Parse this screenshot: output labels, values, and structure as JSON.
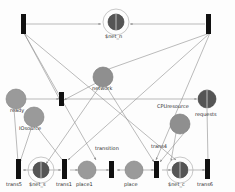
{
  "diagram": {
    "type": "petri-net",
    "colors": {
      "transition_fill": "#111111",
      "place_fill": "#9a9a9a",
      "substitution_fill": "#6e6e6e",
      "arc_stroke": "#8d8d8d",
      "ring_stroke": "#b0b0b0",
      "label_text": "#2a2a2a",
      "background": "#fdfdfd"
    },
    "transitions": [
      {
        "id": "t_top_left",
        "label": "",
        "x": 23,
        "y": 23,
        "w": 5,
        "h": 20
      },
      {
        "id": "t_top_right",
        "label": "",
        "x": 208,
        "y": 23,
        "w": 5,
        "h": 20
      },
      {
        "id": "t_mid",
        "label": "",
        "x": 61,
        "y": 98,
        "w": 5,
        "h": 14
      },
      {
        "id": "t_trans5",
        "label": "trans5",
        "x": 18,
        "y": 166,
        "w": 5,
        "h": 18
      },
      {
        "id": "t_trans1",
        "label": "trans1",
        "x": 64,
        "y": 166,
        "w": 5,
        "h": 18
      },
      {
        "id": "t_transition",
        "label": "transition",
        "x": 111,
        "y": 166,
        "w": 5,
        "h": 16
      },
      {
        "id": "t_trans4",
        "label": "trans4",
        "x": 156,
        "y": 166,
        "w": 5,
        "h": 16
      },
      {
        "id": "t_trans6",
        "label": "trans6",
        "x": 207,
        "y": 166,
        "w": 5,
        "h": 18
      }
    ],
    "places": [
      {
        "id": "p_ready",
        "label": "ready",
        "cx": 16,
        "cy": 99,
        "r": 10
      },
      {
        "id": "p_iosource",
        "label": "IOsource",
        "cx": 34,
        "cy": 117,
        "r": 10
      },
      {
        "id": "p_network",
        "label": "network",
        "cx": 103,
        "cy": 77,
        "r": 10
      },
      {
        "id": "p_cpuresource",
        "label": "CPUresource",
        "cx": 180,
        "cy": 124,
        "r": 10
      },
      {
        "id": "p_place1",
        "label": "place1",
        "cx": 87,
        "cy": 170,
        "r": 9
      },
      {
        "id": "p_place",
        "label": "place",
        "cx": 134,
        "cy": 170,
        "r": 9
      }
    ],
    "substitutions": [
      {
        "id": "s_net_n",
        "label": "$net_n",
        "cx": 116,
        "cy": 22,
        "r": 8,
        "ring": 13
      },
      {
        "id": "s_net_s",
        "label": "$net_s",
        "cx": 41,
        "cy": 170,
        "r": 8,
        "ring": 13
      },
      {
        "id": "s_net_c",
        "label": "$net_c",
        "cx": 180,
        "cy": 170,
        "r": 8,
        "ring": 13
      },
      {
        "id": "s_requests",
        "label": "requests",
        "cx": 207,
        "cy": 99,
        "r": 9,
        "ring": 0
      }
    ],
    "labels": [
      {
        "id": "lbl_net_n",
        "text": "$net_n",
        "x": 105,
        "y": 37
      },
      {
        "id": "lbl_network",
        "text": "network",
        "x": 92,
        "y": 89
      },
      {
        "id": "lbl_ready",
        "text": "ready",
        "x": 12,
        "y": 110
      },
      {
        "id": "lbl_iosource",
        "text": "IOsource",
        "x": 21,
        "y": 128
      },
      {
        "id": "lbl_cpuresource",
        "text": "CPUresource",
        "x": 158,
        "y": 106
      },
      {
        "id": "lbl_requests",
        "text": "requests",
        "x": 196,
        "y": 114
      },
      {
        "id": "lbl_transition",
        "text": "transition",
        "x": 96,
        "y": 150
      },
      {
        "id": "lbl_trans4",
        "text": "trans4",
        "x": 152,
        "y": 148
      },
      {
        "id": "lbl_trans5",
        "text": "trans5",
        "x": 8,
        "y": 184
      },
      {
        "id": "lbl_net_s",
        "text": "$net_s",
        "x": 30,
        "y": 184
      },
      {
        "id": "lbl_trans1",
        "text": "trans1",
        "x": 57,
        "y": 184
      },
      {
        "id": "lbl_place1",
        "text": "place1",
        "x": 77,
        "y": 184
      },
      {
        "id": "lbl_place",
        "text": "place",
        "x": 125,
        "y": 184
      },
      {
        "id": "lbl_net_c",
        "text": "$net_c",
        "x": 169,
        "y": 184
      },
      {
        "id": "lbl_trans6",
        "text": "trans6",
        "x": 198,
        "y": 184
      }
    ]
  }
}
